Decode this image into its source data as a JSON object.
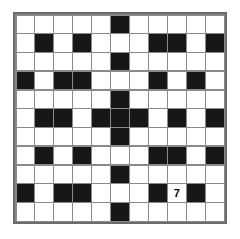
{
  "puzzle": {
    "title": "",
    "type": "crossword-grid",
    "rows": 11,
    "cols": 11,
    "colors": {
      "block": "#171717",
      "open": "#ffffff",
      "gridline": "#8a8a8a",
      "border": "#6b6b6b",
      "page_background": "#ffffff",
      "label_text": "#000000"
    },
    "grid": [
      [
        0,
        0,
        0,
        0,
        0,
        1,
        0,
        0,
        0,
        0,
        0
      ],
      [
        0,
        1,
        0,
        1,
        0,
        0,
        0,
        1,
        1,
        0,
        1
      ],
      [
        0,
        0,
        0,
        0,
        0,
        1,
        0,
        0,
        0,
        0,
        0
      ],
      [
        1,
        0,
        1,
        1,
        0,
        0,
        0,
        1,
        0,
        1,
        0
      ],
      [
        0,
        0,
        0,
        0,
        0,
        1,
        0,
        0,
        0,
        0,
        0
      ],
      [
        0,
        1,
        1,
        0,
        1,
        1,
        1,
        0,
        1,
        0,
        1
      ],
      [
        0,
        0,
        0,
        0,
        0,
        1,
        0,
        0,
        0,
        0,
        0
      ],
      [
        0,
        1,
        0,
        1,
        0,
        0,
        0,
        1,
        1,
        0,
        1
      ],
      [
        0,
        0,
        0,
        0,
        0,
        1,
        0,
        0,
        0,
        0,
        0
      ],
      [
        1,
        0,
        1,
        1,
        0,
        0,
        0,
        1,
        0,
        1,
        0
      ],
      [
        0,
        0,
        0,
        0,
        0,
        1,
        0,
        0,
        0,
        0,
        0
      ]
    ],
    "labels": [
      {
        "row": 9,
        "col": 8,
        "text": "7"
      }
    ]
  }
}
